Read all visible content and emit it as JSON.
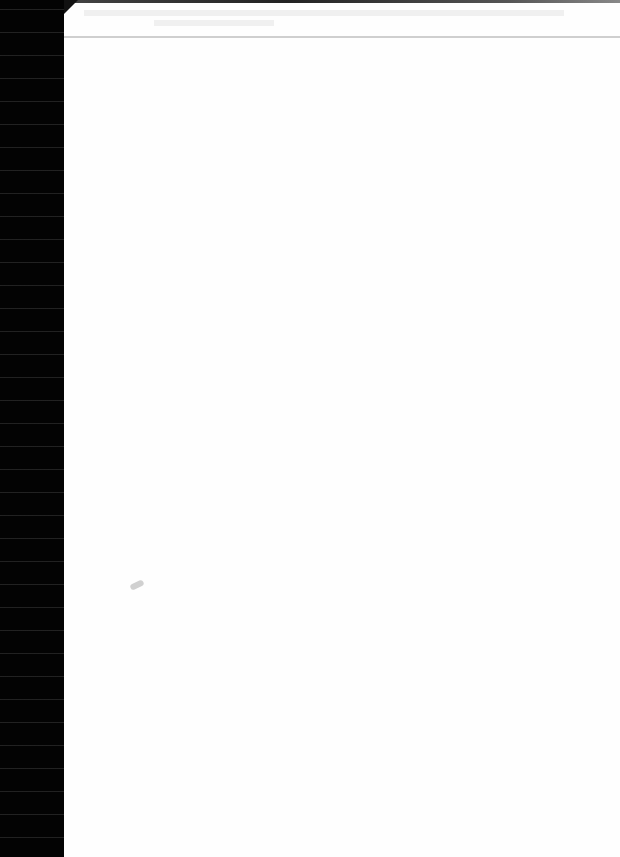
{
  "document": {
    "type": "scanned-page",
    "content": "",
    "colors": {
      "paper": "#fefefe",
      "scan_border": "#030303"
    }
  }
}
